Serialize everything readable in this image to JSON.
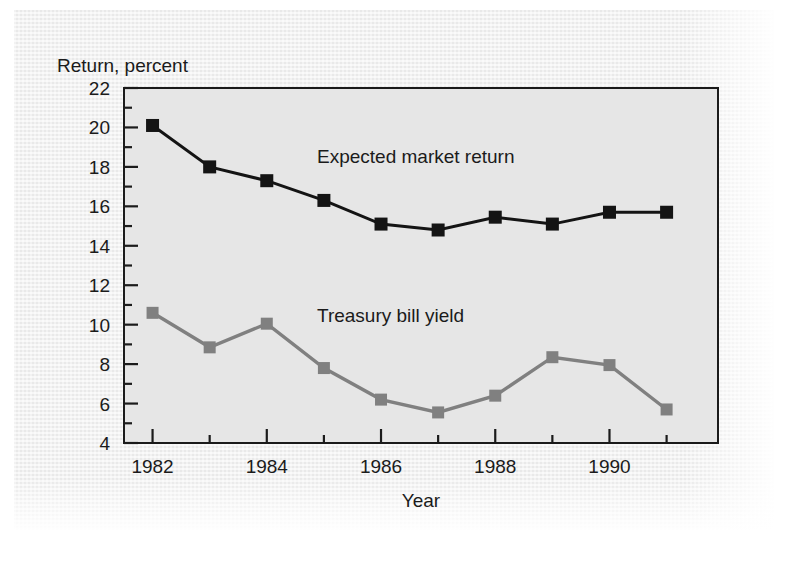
{
  "figure": {
    "background_color": "#efefef",
    "plot_background_color": "#e8e8e8",
    "frame_color": "#1b1b1b"
  },
  "labels": {
    "ylabel": "Return, percent",
    "xlabel": "Year",
    "series_black": "Expected market return",
    "series_gray": "Treasury bill yield"
  },
  "axes": {
    "y_ticks": [
      "22",
      "20",
      "18",
      "16",
      "14",
      "12",
      "10",
      "8",
      "6",
      "4"
    ],
    "x_ticks": [
      "1982",
      "1984",
      "1986",
      "1988",
      "1990"
    ]
  },
  "chart_data": {
    "type": "line",
    "title": "",
    "xlabel": "Year",
    "ylabel": "Return, percent",
    "xlim": [
      1981.5,
      1991.9
    ],
    "ylim": [
      4,
      22
    ],
    "ytick_values": [
      22,
      20,
      18,
      16,
      14,
      12,
      10,
      8,
      6,
      4
    ],
    "ytick_minor_step": 1,
    "xtick_values": [
      1982,
      1984,
      1986,
      1988,
      1990
    ],
    "xtick_minor_values": [
      1983,
      1985,
      1987,
      1989,
      1991
    ],
    "grid": false,
    "legend": "inline-annotations",
    "x": [
      1982,
      1983,
      1984,
      1985,
      1986,
      1987,
      1988,
      1989,
      1990,
      1991
    ],
    "series": [
      {
        "name": "Expected market return",
        "color": "#141414",
        "marker": "square",
        "values": [
          20.1,
          18.0,
          17.3,
          16.3,
          15.1,
          14.8,
          15.45,
          15.1,
          15.7,
          15.7
        ]
      },
      {
        "name": "Treasury bill yield",
        "color": "#808080",
        "marker": "square",
        "values": [
          10.6,
          8.85,
          10.05,
          7.8,
          6.2,
          5.55,
          6.4,
          8.35,
          7.95,
          5.7
        ]
      }
    ],
    "annotations": [
      {
        "text": "Expected market return",
        "x": 1986.0,
        "y": 17.9
      },
      {
        "text": "Treasury bill yield",
        "x": 1986.0,
        "y": 10.6
      }
    ]
  }
}
